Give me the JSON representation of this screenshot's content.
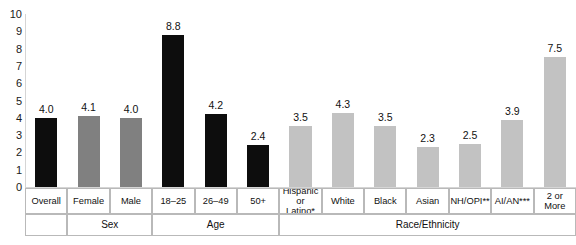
{
  "chart_data": {
    "type": "bar",
    "title": "",
    "xlabel": "",
    "ylabel": "",
    "ylim": [
      0,
      10
    ],
    "ytick_step": 1,
    "yticks": [
      "10",
      "9",
      "8",
      "7",
      "6",
      "5",
      "4",
      "3",
      "2",
      "1",
      "0"
    ],
    "grid": false,
    "legend": "none",
    "categories": [
      "Overall",
      "Female",
      "Male",
      "18–25",
      "26–49",
      "50+",
      "Hispanic or Latino*",
      "White",
      "Black",
      "Asian",
      "NH/OPI**",
      "AI/AN***",
      "2 or More"
    ],
    "values": [
      4.0,
      4.1,
      4.0,
      8.8,
      4.2,
      2.4,
      3.5,
      4.3,
      3.5,
      2.3,
      2.5,
      3.9,
      7.5
    ],
    "data_labels": [
      "4.0",
      "4.1",
      "4.0",
      "8.8",
      "4.2",
      "2.4",
      "3.5",
      "4.3",
      "3.5",
      "2.3",
      "2.5",
      "3.9",
      "7.5"
    ],
    "bar_colors": [
      "#0d0d0d",
      "#808080",
      "#808080",
      "#0d0d0d",
      "#0d0d0d",
      "#0d0d0d",
      "#c2c2c2",
      "#c2c2c2",
      "#c2c2c2",
      "#c2c2c2",
      "#c2c2c2",
      "#c2c2c2",
      "#c2c2c2"
    ],
    "groups": [
      {
        "label": "",
        "span": 1
      },
      {
        "label": "Sex",
        "span": 2
      },
      {
        "label": "Age",
        "span": 3
      },
      {
        "label": "Race/Ethnicity",
        "span": 7
      }
    ]
  },
  "colors": {
    "bar_black": "#0d0d0d",
    "bar_gray_medium": "#808080",
    "bar_gray_light": "#c2c2c2",
    "axis": "#d5d5d5",
    "table_border": "#b9b9b9",
    "text": "#111111",
    "background": "#ffffff"
  },
  "category_label_lines": [
    [
      "Overall"
    ],
    [
      "Female"
    ],
    [
      "Male"
    ],
    [
      "18–25"
    ],
    [
      "26–49"
    ],
    [
      "50+"
    ],
    [
      "Hispanic",
      "or Latino*"
    ],
    [
      "White"
    ],
    [
      "Black"
    ],
    [
      "Asian"
    ],
    [
      "NH/OPI**"
    ],
    [
      "AI/AN***"
    ],
    [
      "2 or More"
    ]
  ]
}
